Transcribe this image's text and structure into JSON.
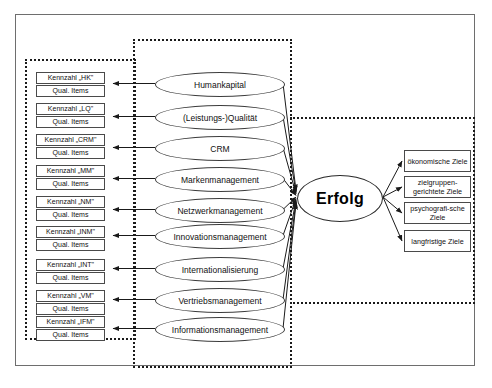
{
  "diagram": {
    "title_visible": false,
    "success_node": {
      "label": "Erfolg"
    },
    "indicator_label_secondary": "Qual. Items",
    "indicators": [
      {
        "code": "HK",
        "label": "Kennzahl „HK\"",
        "sub": "Qual. Items"
      },
      {
        "code": "LQ",
        "label": "Kennzahl „LQ\"",
        "sub": "Qual. Items"
      },
      {
        "code": "CRM",
        "label": "Kennzahl „CRM\"",
        "sub": "Qual. Items"
      },
      {
        "code": "MM",
        "label": "Kennzahl „MM\"",
        "sub": "Qual. Items"
      },
      {
        "code": "NM",
        "label": "Kennzahl „NM\"",
        "sub": "Qual. Items"
      },
      {
        "code": "INM",
        "label": "Kennzahl „INM\"",
        "sub": "Qual. Items"
      },
      {
        "code": "INT",
        "label": "Kennzahl „INT\"",
        "sub": "Qual. Items"
      },
      {
        "code": "VM",
        "label": "Kennzahl „VM\"",
        "sub": "Qual. Items"
      },
      {
        "code": "IFM",
        "label": "Kennzahl „IFM\"",
        "sub": "Qual. Items"
      }
    ],
    "constructs": [
      {
        "label": "Humankapital"
      },
      {
        "label": "(Leistungs-)Qualität"
      },
      {
        "label": "CRM"
      },
      {
        "label": "Markenmanagement"
      },
      {
        "label": "Netzwerkmanagement"
      },
      {
        "label": "Innovationsmanagement"
      },
      {
        "label": "Internationalisierung"
      },
      {
        "label": "Vertriebsmanagement"
      },
      {
        "label": "Informationsmanagement"
      }
    ],
    "goals": [
      {
        "label": "ökonomische Ziele"
      },
      {
        "label": "zielgruppen-gerichtete Ziele"
      },
      {
        "label": "psychografi-sche Ziele"
      },
      {
        "label": "langfristige Ziele"
      }
    ],
    "colors": {
      "background": "#ffffff",
      "frame_border": "#6e6e6e",
      "dotted_border": "#1a1a1a",
      "shape_border": "#3c3c3c",
      "text": "#111111"
    }
  }
}
